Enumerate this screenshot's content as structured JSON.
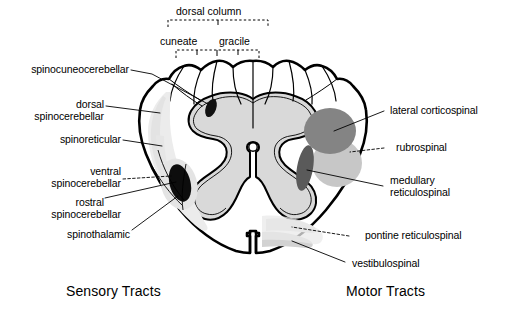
{
  "figure": {
    "title_sensory": "Sensory Tracts",
    "title_motor": "Motor Tracts"
  },
  "brackets": {
    "dorsal_column": "dorsal column",
    "cuneate": "cuneate",
    "gracile": "gracile"
  },
  "labels_left": [
    {
      "id": "spinocuneocerebellar",
      "text": "spinocuneocerebellar"
    },
    {
      "id": "dorsal-spinocerebellar-1",
      "text": "dorsal"
    },
    {
      "id": "dorsal-spinocerebellar-2",
      "text": "spinocerebellar"
    },
    {
      "id": "spinoreticular",
      "text": "spinoreticular"
    },
    {
      "id": "ventral-spinocerebellar-1",
      "text": "ventral"
    },
    {
      "id": "ventral-spinocerebellar-2",
      "text": "spinocerebellar"
    },
    {
      "id": "rostral-spinocerebellar-1",
      "text": "rostral"
    },
    {
      "id": "rostral-spinocerebellar-2",
      "text": "spinocerebellar"
    },
    {
      "id": "spinothalamic",
      "text": "spinothalamic"
    }
  ],
  "labels_right": [
    {
      "id": "lateral-corticospinal",
      "text": "lateral corticospinal"
    },
    {
      "id": "rubrospinal",
      "text": "rubrospinal"
    },
    {
      "id": "medullary-reticulospinal-1",
      "text": "medullary"
    },
    {
      "id": "medullary-reticulospinal-2",
      "text": "reticulospinal"
    },
    {
      "id": "pontine-reticulospinal",
      "text": "pontine reticulospinal"
    },
    {
      "id": "vestibulospinal",
      "text": "vestibulospinal"
    }
  ],
  "colors": {
    "outline": "#000000",
    "gray_matter_fill": "#d9d9d9",
    "white_matter_fill": "#ffffff",
    "tract_dark": "#0d0d0d",
    "tract_corticospinal": "#7d7d7d",
    "tract_rubrospinal": "#c2c2c2",
    "tract_medullary": "#5c5c5c",
    "tract_pontine": "#dcdcdc",
    "tract_vestibulospinal": "#cfcfcf",
    "tract_light_shade": "#e8e8e8",
    "leader_line": "#000000",
    "background": "#ffffff"
  },
  "anatomy": {
    "view": "spinal cord transverse section",
    "central_canal": "central canal",
    "ventral_median_fissure": "ventral median fissure",
    "dorsal_median_septum": "dorsal median septum",
    "left_half": "sensory tracts half",
    "right_half": "motor tracts half"
  }
}
